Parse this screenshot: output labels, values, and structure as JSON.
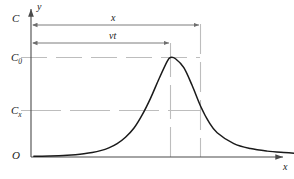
{
  "chart_data": {
    "type": "line",
    "title": "",
    "subtitle": "",
    "xlabel": "x",
    "ylabel": "y",
    "grid": false,
    "legend": null,
    "axis_origin_label": "O",
    "y_axis_top_label": "C",
    "y_tick_labels": [
      "C",
      "C_0",
      "C_x",
      "O"
    ],
    "y_ticks": [
      {
        "label": "C",
        "sub": "",
        "value": 1.05
      },
      {
        "label": "C",
        "sub": "0",
        "value": 0.78
      },
      {
        "label": "C",
        "sub": "x",
        "value": 0.4
      },
      {
        "label": "O",
        "sub": "",
        "value": 0.0
      }
    ],
    "x_ticks": [],
    "annotations": [
      {
        "name": "dimension-x",
        "label": "x",
        "from_x": 0.0,
        "to_x": 1.0,
        "at_y": 1.18
      },
      {
        "name": "dimension-vt",
        "label": "vt",
        "from_x": 0.0,
        "to_x": 0.82,
        "at_y": 1.04
      }
    ],
    "series": [
      {
        "name": "concentration-curve",
        "color": "#1a1a1a",
        "peak_x": 0.82,
        "peak_y": 0.78,
        "crossing_x": 1.0,
        "crossing_y": 0.4,
        "x": [
          0.0,
          0.05,
          0.1,
          0.15,
          0.2,
          0.25,
          0.3,
          0.35,
          0.4,
          0.45,
          0.5,
          0.55,
          0.6,
          0.65,
          0.7,
          0.75,
          0.8,
          0.82,
          0.85,
          0.9,
          0.95,
          1.0,
          1.05,
          1.1,
          1.2,
          1.3,
          1.4,
          1.5,
          1.6,
          1.7,
          1.8,
          1.9,
          2.0
        ],
        "y": [
          0.005,
          0.006,
          0.008,
          0.01,
          0.013,
          0.018,
          0.025,
          0.035,
          0.05,
          0.072,
          0.105,
          0.155,
          0.225,
          0.33,
          0.46,
          0.61,
          0.75,
          0.78,
          0.77,
          0.7,
          0.56,
          0.4,
          0.275,
          0.19,
          0.105,
          0.066,
          0.046,
          0.035,
          0.027,
          0.022,
          0.018,
          0.015,
          0.013
        ]
      }
    ],
    "guide_lines": {
      "horizontal": [
        {
          "name": "C0-guide",
          "value": 0.78,
          "style": "dashed",
          "color": "#b5b5b5"
        },
        {
          "name": "Cx-guide",
          "value": 0.4,
          "style": "dashed",
          "color": "#b5b5b5"
        }
      ],
      "vertical": [
        {
          "name": "vt-guide",
          "at_x": 0.82,
          "style": "dashed",
          "color": "#b5b5b5"
        },
        {
          "name": "x-guide",
          "at_x": 1.0,
          "style": "dashed",
          "color": "#b5b5b5"
        }
      ]
    },
    "colors": {
      "curve": "#1a1a1a",
      "axis": "#4a4a4a",
      "guide": "#b5b5b5",
      "arrow": "#7a7a7a",
      "text": "#1a1a1a",
      "background": "#ffffff"
    }
  },
  "labels": {
    "y_axis": "y",
    "x_axis": "x",
    "origin": "O",
    "top": "C",
    "c_zero_main": "C",
    "c_zero_sub": "0",
    "c_x_main": "C",
    "c_x_sub": "x",
    "dim_x": "x",
    "dim_vt": "vt"
  }
}
